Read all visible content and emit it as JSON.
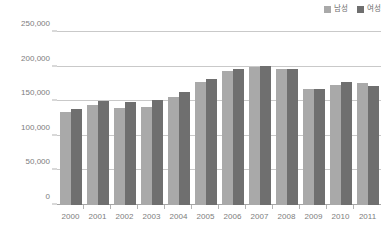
{
  "chart_data": {
    "type": "bar",
    "title": "",
    "subtitle": "",
    "xlabel": "",
    "ylabel": "",
    "categories": [
      "2000",
      "2001",
      "2002",
      "2003",
      "2004",
      "2005",
      "2006",
      "2007",
      "2008",
      "2009",
      "2010",
      "2011"
    ],
    "series": [
      {
        "name": "남성",
        "color": "#a9a9a9",
        "values": [
          135000,
          145000,
          140000,
          141000,
          156000,
          178000,
          194000,
          199000,
          196000,
          167000,
          174000,
          176000
        ]
      },
      {
        "name": "여성",
        "color": "#6f6f6f",
        "values": [
          139000,
          151000,
          149000,
          152000,
          163000,
          182000,
          197000,
          201000,
          197000,
          168000,
          178000,
          172000
        ]
      }
    ],
    "ylim": [
      0,
      250000
    ],
    "yticks": [
      0,
      50000,
      100000,
      150000,
      200000,
      250000
    ],
    "ytick_labels": [
      "0",
      "50,000",
      "100,000",
      "150,000",
      "200,000",
      "250,000"
    ],
    "grid": true,
    "legend_position": "top-right"
  },
  "legend": {
    "entries": [
      {
        "label": "남성",
        "color": "#a9a9a9"
      },
      {
        "label": "여성",
        "color": "#6f6f6f"
      }
    ]
  },
  "colors": {
    "male_bar": "#a9a9a9",
    "female_bar": "#6f6f6f",
    "gridline": "#c9c9c9",
    "axis": "#a5a5a5",
    "text": "#7d7d7d",
    "background": "#ffffff"
  }
}
